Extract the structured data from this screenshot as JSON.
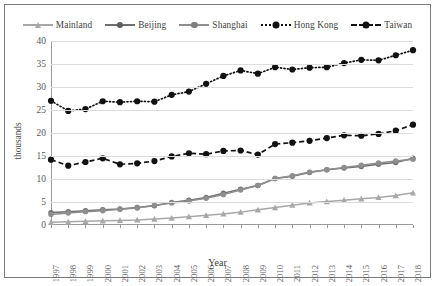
{
  "chart_data": {
    "type": "line",
    "title": "",
    "xlabel": "Year",
    "ylabel": "thousands",
    "ylim": [
      0,
      40
    ],
    "ytick_step": 5,
    "yticks": [
      0,
      5,
      10,
      15,
      20,
      25,
      30,
      35,
      40
    ],
    "grid": true,
    "legend_position": "top",
    "categories": [
      "1997",
      "1998",
      "1999",
      "2000",
      "2001",
      "2002",
      "2003",
      "2004",
      "2005",
      "2006",
      "2007",
      "2008",
      "2009",
      "2010",
      "2011",
      "2012",
      "2013",
      "2014",
      "2015",
      "2016",
      "2017",
      "2018"
    ],
    "series": [
      {
        "name": "Mainland",
        "color": "#a8a8a8",
        "marker": "triangle",
        "linestyle": "solid",
        "values": [
          0.6,
          0.7,
          0.8,
          0.9,
          1.0,
          1.1,
          1.3,
          1.5,
          1.8,
          2.1,
          2.4,
          2.8,
          3.3,
          3.8,
          4.3,
          4.8,
          5.1,
          5.4,
          5.7,
          6.0,
          6.4,
          7.0
        ]
      },
      {
        "name": "Beijing",
        "color": "#6f6f6f",
        "marker": "circle",
        "linestyle": "solid",
        "values": [
          2.7,
          2.9,
          3.1,
          3.3,
          3.5,
          3.8,
          4.2,
          4.9,
          5.4,
          6.0,
          6.9,
          7.8,
          8.6,
          10.1,
          10.6,
          11.4,
          12.0,
          12.4,
          12.7,
          13.2,
          13.6,
          14.5
        ]
      },
      {
        "name": "Shanghai",
        "color": "#8e8e8e",
        "marker": "circle",
        "linestyle": "solid",
        "values": [
          2.3,
          2.6,
          2.9,
          3.1,
          3.4,
          3.7,
          4.3,
          4.8,
          5.2,
          5.8,
          6.6,
          7.6,
          8.6,
          10.1,
          10.7,
          11.5,
          12.0,
          12.5,
          13.0,
          13.5,
          13.9,
          14.3
        ]
      },
      {
        "name": "Hong Kong",
        "color": "#111111",
        "marker": "circle",
        "linestyle": "dotted",
        "values": [
          27.0,
          24.8,
          25.2,
          26.9,
          26.7,
          26.9,
          26.8,
          28.3,
          29.0,
          30.7,
          32.4,
          33.6,
          32.9,
          34.3,
          33.8,
          34.2,
          34.3,
          35.2,
          35.9,
          35.8,
          36.9,
          38.0
        ]
      },
      {
        "name": "Taiwan",
        "color": "#111111",
        "marker": "circle",
        "linestyle": "dashed",
        "values": [
          14.2,
          12.9,
          13.7,
          14.5,
          13.2,
          13.4,
          13.9,
          14.9,
          15.6,
          15.4,
          16.1,
          16.2,
          15.3,
          17.6,
          17.9,
          18.3,
          18.9,
          19.5,
          19.4,
          19.8,
          20.5,
          21.8
        ]
      }
    ]
  },
  "legend": {
    "items": [
      {
        "label": "Mainland"
      },
      {
        "label": "Beijing"
      },
      {
        "label": "Shanghai"
      },
      {
        "label": "Hong Kong"
      },
      {
        "label": "Taiwan"
      }
    ]
  }
}
